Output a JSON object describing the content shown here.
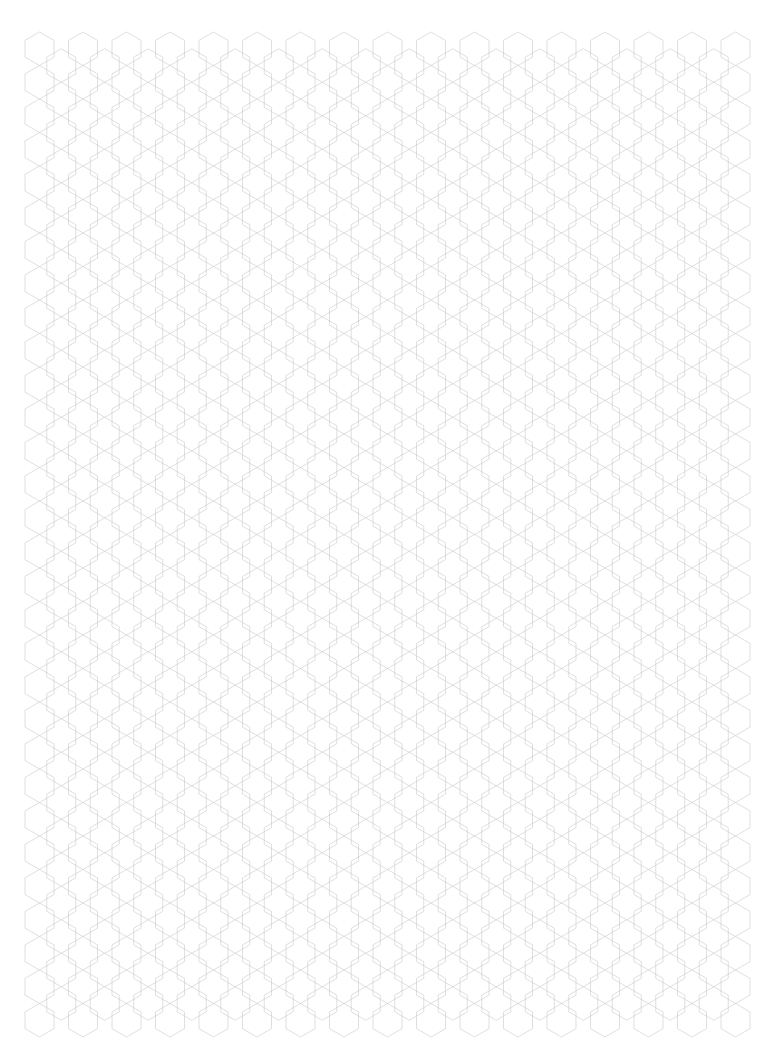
{
  "page": {
    "width": 768,
    "height": 1054,
    "background_color": "#ffffff",
    "orientation": "portrait",
    "content_type": "printable-grid-sheet",
    "visible_text": ""
  },
  "grid": {
    "name": "hexagonal-graph-paper",
    "pattern": "honeycomb",
    "hex_orientation": "pointy-top",
    "line_color": "#c9c9cc",
    "line_width_px": 0.6,
    "fill": "none",
    "margin_left_px": 25,
    "margin_top_px": 32,
    "margin_right_px": 46,
    "margin_bottom_px": 41,
    "hex_width_px": 29.0,
    "hex_height_px": 33.5,
    "column_step_px": 21.75,
    "row_step_px": 33.5,
    "column_count": 33,
    "row_count": 31,
    "grid_left_px": 25,
    "grid_top_px": 32,
    "grid_right_px": 722,
    "grid_bottom_px": 1013
  }
}
